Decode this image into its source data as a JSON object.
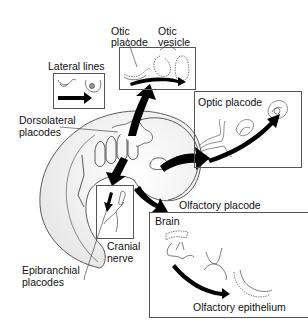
{
  "diagram": {
    "labels": {
      "lateral_lines": "Lateral lines",
      "otic_placode_1": "Otic",
      "otic_placode_2": "placode",
      "otic_vesicle_1": "Otic",
      "otic_vesicle_2": "vesicle",
      "dorsolateral_1": "Dorsolateral",
      "dorsolateral_2": "placodes",
      "optic_placode": "Optic placode",
      "olfactory_placode": "Olfactory placode",
      "brain": "Brain",
      "olfactory_epithelium": "Olfactory epithelium",
      "cranial_1": "Cranial",
      "cranial_2": "nerve",
      "epibranchial_1": "Epibranchial",
      "epibranchial_2": "placodes"
    },
    "colors": {
      "line": "#222222",
      "box_border": "#555555",
      "embryo_fill": "#f2f2f2",
      "arrow": "#000000"
    }
  }
}
